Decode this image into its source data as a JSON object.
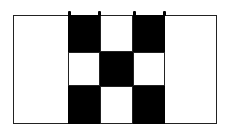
{
  "diagram": {
    "type": "checkerboard-pattern",
    "frame": {
      "x": 13,
      "y": 15,
      "width": 204,
      "height": 109,
      "border_color": "#222222"
    },
    "grid": {
      "origin_x": 68,
      "origin_y": 15,
      "col_widths": [
        32,
        33,
        32
      ],
      "row_heights": [
        37,
        34,
        38
      ],
      "cells": [
        [
          "black",
          "white",
          "black"
        ],
        [
          "white",
          "black",
          "white"
        ],
        [
          "black",
          "white",
          "black"
        ]
      ]
    },
    "colors": {
      "black": "#000000",
      "white": "#ffffff"
    },
    "top_ticks_x": [
      68,
      98,
      133,
      163
    ]
  }
}
